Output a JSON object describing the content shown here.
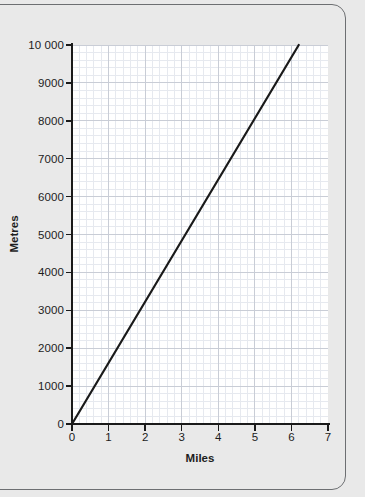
{
  "chart_data": {
    "type": "line",
    "title": "",
    "xlabel": "Miles",
    "ylabel": "Metres",
    "xlim": [
      0,
      7
    ],
    "ylim": [
      0,
      10000
    ],
    "x_ticks": [
      0,
      1,
      2,
      3,
      4,
      5,
      6,
      7
    ],
    "x_tick_labels": [
      "0",
      "1",
      "2",
      "3",
      "4",
      "5",
      "6",
      "7"
    ],
    "y_ticks": [
      0,
      1000,
      2000,
      3000,
      4000,
      5000,
      6000,
      7000,
      8000,
      9000,
      10000
    ],
    "y_tick_labels": [
      "0",
      "1000",
      "2000",
      "3000",
      "4000",
      "5000",
      "6000",
      "7000",
      "8000",
      "9000",
      "10 000"
    ],
    "grid": true,
    "grid_minor_step_x": 0.2,
    "grid_minor_step_y": 200,
    "legend": null,
    "series": [
      {
        "name": "Miles to metres conversion",
        "color": "#1a1a1a",
        "x": [
          0,
          6.2
        ],
        "y": [
          0,
          10000
        ],
        "points": [
          {
            "x": 0,
            "y": 0
          },
          {
            "x": 1,
            "y": 1610
          },
          {
            "x": 2,
            "y": 3230
          },
          {
            "x": 3,
            "y": 4840
          },
          {
            "x": 4,
            "y": 6450
          },
          {
            "x": 5,
            "y": 8060
          },
          {
            "x": 6,
            "y": 9680
          },
          {
            "x": 6.2,
            "y": 10000
          }
        ]
      }
    ]
  },
  "colors": {
    "page_background": "#e9e9e9",
    "frame_border": "#6d6f72",
    "plot_background": "#ffffff",
    "axis": "#1a1a1a",
    "grid_major": "#c9cdd6",
    "grid_minor": "#e6e9ef",
    "line": "#1a1a1a",
    "text": "#1d1d1d"
  }
}
